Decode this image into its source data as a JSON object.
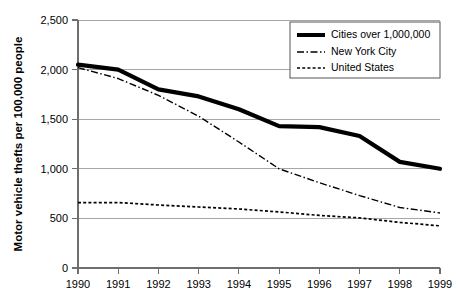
{
  "chart_data": {
    "type": "line",
    "title": "",
    "xlabel": "",
    "ylabel": "Motor vehicle thefts per 100,000 people",
    "x": [
      1990,
      1991,
      1992,
      1993,
      1994,
      1995,
      1996,
      1997,
      1998,
      1999
    ],
    "categories": [
      "1990",
      "1991",
      "1992",
      "1993",
      "1994",
      "1995",
      "1996",
      "1997",
      "1998",
      "1999"
    ],
    "xlim": [
      1990,
      1999
    ],
    "ylim": [
      0,
      2500
    ],
    "y_ticks": [
      0,
      500,
      1000,
      1500,
      2000,
      2500
    ],
    "y_tick_labels": [
      "0",
      "500",
      "1,000",
      "1,500",
      "2,000",
      "2,500"
    ],
    "grid": true,
    "legend_position": "top-right",
    "series": [
      {
        "name": "Cities over 1,000,000",
        "style": "thick-solid",
        "values": [
          2050,
          2000,
          1800,
          1730,
          1600,
          1430,
          1420,
          1330,
          1070,
          1000
        ]
      },
      {
        "name": "New York City",
        "style": "dash-dot",
        "values": [
          2020,
          1910,
          1740,
          1530,
          1270,
          1000,
          860,
          730,
          610,
          555
        ]
      },
      {
        "name": "United States",
        "style": "dotted",
        "values": [
          660,
          660,
          635,
          615,
          595,
          565,
          530,
          505,
          460,
          425
        ]
      }
    ]
  },
  "legend": {
    "items": [
      {
        "label": "Cities over 1,000,000"
      },
      {
        "label": "New York City"
      },
      {
        "label": "United States"
      }
    ]
  },
  "axes": {
    "y_title": "Motor vehicle thefts per 100,000 people",
    "y_labels": [
      "2,500",
      "2,000",
      "1,500",
      "1,000",
      "500",
      "0"
    ],
    "x_labels": [
      "1990",
      "1991",
      "1992",
      "1993",
      "1994",
      "1995",
      "1996",
      "1997",
      "1998",
      "1999"
    ]
  }
}
